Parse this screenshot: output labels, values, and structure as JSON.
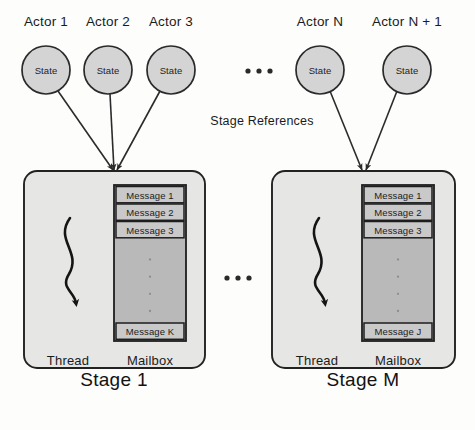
{
  "figure": {
    "kind": "actor-stage-architecture-diagram",
    "width": 475,
    "height": 430,
    "background_color": "#fdfdfc",
    "ink_color": "#1b1b1b"
  },
  "colors": {
    "circle_fill": "#d4d4d4",
    "circle_stroke": "#2a2a2a",
    "stage_fill": "#e6e6e4",
    "stage_stroke": "#222222",
    "mailbox_fill": "#b9b9b9",
    "mailbox_stroke": "#1e1e1e",
    "message_fill": "#c9c9c9",
    "arrow_color": "#2b2b2b"
  },
  "actors": [
    {
      "title": "Actor 1",
      "state_label": "State",
      "cx": 46,
      "cy": 70,
      "r": 24
    },
    {
      "title": "Actor 2",
      "state_label": "State",
      "cx": 108,
      "cy": 70,
      "r": 24
    },
    {
      "title": "Actor 3",
      "state_label": "State",
      "cx": 171,
      "cy": 70,
      "r": 24
    },
    {
      "title": "Actor N",
      "state_label": "State",
      "cx": 320,
      "cy": 70,
      "r": 24
    },
    {
      "title": "Actor N + 1",
      "state_label": "State",
      "cx": 407,
      "cy": 70,
      "r": 24
    }
  ],
  "actor_ellipsis": {
    "text": "• • •",
    "cx": 259,
    "cy": 71,
    "dots": 3
  },
  "stage_ellipsis": {
    "text": "• • •",
    "cx": 238,
    "cy": 278,
    "dots": 3
  },
  "stage_references": {
    "label": "Stage References",
    "cx": 262,
    "cy": 122
  },
  "arrows": [
    {
      "from_actor": "Actor 1",
      "to_stage": "Stage 1",
      "x1": 58,
      "y1": 91,
      "x2": 113,
      "y2": 170
    },
    {
      "from_actor": "Actor 2",
      "to_stage": "Stage 1",
      "x1": 110,
      "y1": 94,
      "x2": 114,
      "y2": 170
    },
    {
      "from_actor": "Actor 3",
      "to_stage": "Stage 1",
      "x1": 160,
      "y1": 91,
      "x2": 117,
      "y2": 170
    },
    {
      "from_actor": "Actor N",
      "to_stage": "Stage M",
      "x1": 330,
      "y1": 91,
      "x2": 362,
      "y2": 170
    },
    {
      "from_actor": "Actor N + 1",
      "to_stage": "Stage M",
      "x1": 397,
      "y1": 91,
      "x2": 366,
      "y2": 170
    }
  ],
  "stages": [
    {
      "caption": "Stage 1",
      "box": {
        "x": 24,
        "y": 171,
        "w": 181,
        "h": 197,
        "radius": 13
      },
      "thread": {
        "label": "Thread",
        "label_cx": 68,
        "label_cy": 353
      },
      "mailbox": {
        "label": "Mailbox",
        "label_cx": 150,
        "label_cy": 353,
        "x": 114,
        "y": 185,
        "w": 72,
        "h": 156,
        "messages": [
          "Message 1",
          "Message 2",
          "Message 3"
        ],
        "last_message": "Message K",
        "vertical_ellipsis_dots": 4
      }
    },
    {
      "caption": "Stage M",
      "box": {
        "x": 272,
        "y": 171,
        "w": 183,
        "h": 197,
        "radius": 13
      },
      "thread": {
        "label": "Thread",
        "label_cx": 317,
        "label_cy": 353
      },
      "mailbox": {
        "label": "Mailbox",
        "label_cx": 398,
        "label_cy": 353,
        "x": 362,
        "y": 185,
        "w": 72,
        "h": 156,
        "messages": [
          "Message 1",
          "Message 2",
          "Message 3"
        ],
        "last_message": "Message J",
        "vertical_ellipsis_dots": 4
      }
    }
  ],
  "captions": [
    {
      "text": "Stage 1",
      "cx": 114,
      "cy": 381
    },
    {
      "text": "Stage M",
      "cx": 363,
      "cy": 381
    }
  ]
}
